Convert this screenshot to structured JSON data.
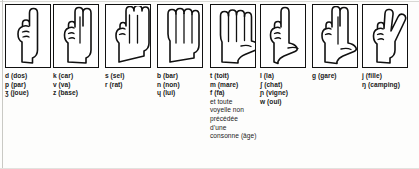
{
  "chart": {
    "columns": [
      {
        "key": "column-1",
        "handshape": "index-finger-extended",
        "x": 5,
        "entries": [
          {
            "symbol": "d",
            "example": "(dos)"
          },
          {
            "symbol": "p",
            "example": "(par)"
          },
          {
            "symbol": "ʒ",
            "example": "(joue)"
          }
        ],
        "notes": []
      },
      {
        "key": "column-2",
        "handshape": "index-and-middle-extended",
        "x": 53,
        "entries": [
          {
            "symbol": "k",
            "example": "(car)"
          },
          {
            "symbol": "v",
            "example": "(va)"
          },
          {
            "symbol": "z",
            "example": "(base)"
          }
        ],
        "notes": []
      },
      {
        "key": "column-3",
        "handshape": "three-fingers-extended",
        "x": 105,
        "entries": [
          {
            "symbol": "s",
            "example": "(sel)"
          },
          {
            "symbol": "r",
            "example": "(rat)"
          }
        ],
        "notes": []
      },
      {
        "key": "column-4",
        "handshape": "four-fingers-flat",
        "x": 157,
        "entries": [
          {
            "symbol": "b",
            "example": "(bar)"
          },
          {
            "symbol": "n",
            "example": "(non)"
          },
          {
            "symbol": "ɥ",
            "example": "(lui)"
          }
        ],
        "notes": []
      },
      {
        "key": "column-5",
        "handshape": "open-hand-thumb-out",
        "x": 210,
        "entries": [
          {
            "symbol": "t",
            "example": "(toit)"
          },
          {
            "symbol": "m",
            "example": "(mare)"
          },
          {
            "symbol": "f",
            "example": "(fa)"
          }
        ],
        "notes": [
          "et toute",
          "voyelle non",
          "précédée",
          "d’une",
          "consonne (âge)"
        ]
      },
      {
        "key": "column-6",
        "handshape": "index-extended-thumb-out",
        "x": 260,
        "entries": [
          {
            "symbol": "l",
            "example": "(la)"
          },
          {
            "symbol": "ʃ",
            "example": "(chat)"
          },
          {
            "symbol": "ɲ",
            "example": "(vigne)"
          },
          {
            "symbol": "w",
            "example": "(oui)"
          }
        ],
        "notes": []
      },
      {
        "key": "column-7",
        "handshape": "two-fingers-thumb-out",
        "x": 312,
        "entries": [
          {
            "symbol": "g",
            "example": "(gare)"
          }
        ],
        "notes": []
      },
      {
        "key": "column-8",
        "handshape": "victory-v-sign",
        "x": 362,
        "entries": [
          {
            "symbol": "j",
            "example": "(fille)"
          },
          {
            "symbol": "ŋ",
            "example": "(camping)"
          }
        ],
        "notes": []
      }
    ]
  },
  "colors": {
    "ink": "#1a1a1a",
    "frame": "#111111",
    "paper": "#fdfdfc"
  }
}
